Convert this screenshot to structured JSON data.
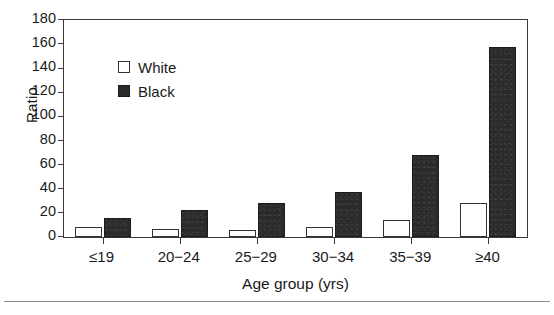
{
  "chart_data": {
    "type": "bar",
    "title": "",
    "xlabel": "Age group (yrs)",
    "ylabel": "Ratio",
    "categories": [
      "≤19",
      "20−24",
      "25−29",
      "30−34",
      "35−39",
      "≥40"
    ],
    "series": [
      {
        "name": "White",
        "color": "#ffffff",
        "values": [
          8,
          7,
          6,
          8,
          14,
          28
        ]
      },
      {
        "name": "Black",
        "color": "#2b2b2b",
        "values": [
          16,
          22,
          28,
          37,
          68,
          158
        ]
      }
    ],
    "ylim": [
      0,
      180
    ],
    "ytick_values": [
      0,
      20,
      40,
      60,
      80,
      100,
      120,
      140,
      160,
      180
    ],
    "ytick_labels": [
      "0",
      "20",
      "40",
      "60",
      "80",
      "100",
      "120",
      "140",
      "160",
      "180"
    ],
    "grid": false,
    "legend_position": "upper-left-inside",
    "legend_entries": [
      "White",
      "Black"
    ]
  },
  "axes": {
    "y_title": "Ratio",
    "x_title": "Age group (yrs)"
  },
  "legend": {
    "items": [
      {
        "label": "White",
        "swatch": "white-square-icon"
      },
      {
        "label": "Black",
        "swatch": "black-square-icon"
      }
    ]
  }
}
